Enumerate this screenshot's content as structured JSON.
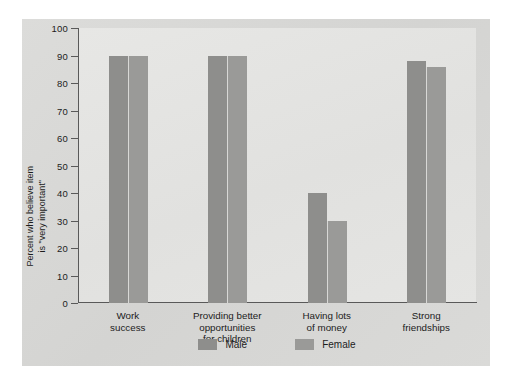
{
  "chart_data": {
    "type": "bar",
    "title": "",
    "xlabel": "",
    "ylabel": "Percent who believe item is \"very important\"",
    "ylabel_line1": "Percent who believe item",
    "ylabel_line2": "is \"very important\"",
    "ylim": [
      0,
      100
    ],
    "ytick_step": 10,
    "yticks": [
      "100",
      "90",
      "80",
      "70",
      "60",
      "50",
      "40",
      "30",
      "20",
      "10",
      "0"
    ],
    "grid": false,
    "legend_position": "bottom-center",
    "categories": [
      "Work success",
      "Providing better opportunities for children",
      "Having lots of money",
      "Strong friendships"
    ],
    "category_lines": [
      [
        "Work",
        "success"
      ],
      [
        "Providing better",
        "opportunities",
        "for children"
      ],
      [
        "Having lots",
        "of money"
      ],
      [
        "Strong",
        "friendships"
      ]
    ],
    "series": [
      {
        "name": "Male",
        "color": "#8e8e8c",
        "values": [
          90,
          90,
          40,
          88
        ]
      },
      {
        "name": "Female",
        "color": "#9a9a98",
        "values": [
          90,
          90,
          30,
          86
        ]
      }
    ]
  },
  "legend": {
    "items": [
      {
        "label": "Male"
      },
      {
        "label": "Female"
      }
    ]
  },
  "colors": {
    "figure_background": "#d9d9d7",
    "plot_background": "#e4e4e2",
    "axis": "#595959",
    "text": "#1c1c1c",
    "male_bar": "#8e8e8c",
    "female_bar": "#9a9a98"
  }
}
